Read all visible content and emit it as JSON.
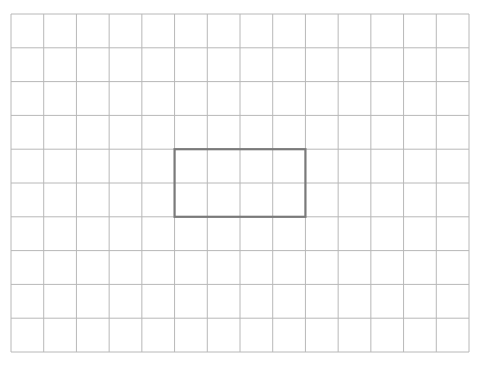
{
  "diagram": {
    "type": "grid-with-rectangle",
    "grid": {
      "columns": 14,
      "rows": 10,
      "left": 11,
      "top": 14,
      "right": 469,
      "bottom": 352,
      "line_color": "#b8b8b8"
    },
    "rectangle": {
      "col_start": 5,
      "row_start": 4,
      "width_cells": 4,
      "height_cells": 2,
      "stroke_color": "#7a7a7a",
      "stroke_width": 2.2
    }
  }
}
